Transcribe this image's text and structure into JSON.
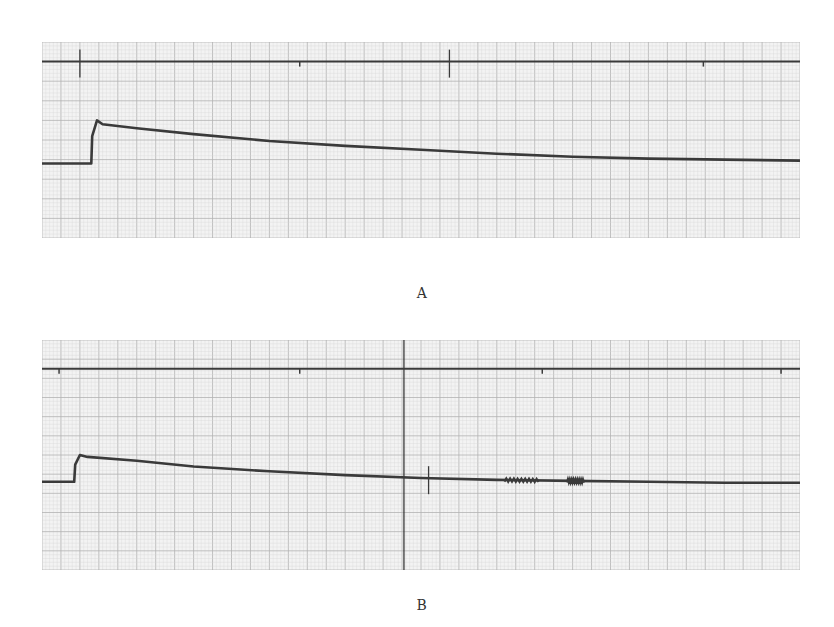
{
  "figure": {
    "panels": [
      {
        "id": "A",
        "label": "A"
      },
      {
        "id": "B",
        "label": "B"
      }
    ]
  },
  "colors": {
    "paper": "#f3f3f3",
    "grid_minor": "#d6d6d6",
    "grid_major": "#b3b3b3",
    "trace": "#3a3a3a",
    "label": "#333333"
  },
  "chart_data": [
    {
      "type": "line",
      "title": "A",
      "xlabel": "",
      "ylabel": "",
      "grid": true,
      "xlim": [
        0,
        40
      ],
      "ylim": [
        0,
        10
      ],
      "major_divisions_x": 40,
      "major_divisions_y": 10,
      "minor_per_major": 5,
      "series": [
        {
          "name": "reference",
          "x": [
            0,
            40
          ],
          "y": [
            9.0,
            9.0
          ],
          "event_marks_x": [
            2.0,
            21.5
          ],
          "small_ticks_x": [
            13.6,
            34.9
          ]
        },
        {
          "name": "signal",
          "x": [
            0,
            2.6,
            2.65,
            2.9,
            3.2,
            5,
            8,
            12,
            16,
            20,
            24,
            28,
            32,
            36,
            40
          ],
          "y": [
            3.8,
            3.8,
            5.2,
            6.0,
            5.8,
            5.6,
            5.3,
            4.95,
            4.7,
            4.5,
            4.3,
            4.15,
            4.05,
            4.0,
            3.95
          ]
        }
      ]
    },
    {
      "type": "line",
      "title": "B",
      "xlabel": "",
      "ylabel": "",
      "grid": true,
      "xlim": [
        0,
        40
      ],
      "ylim": [
        0,
        12
      ],
      "major_divisions_x": 40,
      "major_divisions_y": 12,
      "minor_per_major": 5,
      "series": [
        {
          "name": "reference",
          "x": [
            0,
            40
          ],
          "y": [
            10.5,
            10.5
          ],
          "event_marks_x": [
            19.1
          ],
          "small_ticks_x": [
            0.9,
            13.6,
            26.4,
            39.0
          ]
        },
        {
          "name": "signal",
          "x": [
            0,
            1.7,
            1.75,
            2.0,
            2.4,
            5,
            8,
            12,
            16,
            20,
            24,
            28,
            32,
            36,
            40
          ],
          "y": [
            4.6,
            4.6,
            5.5,
            6.0,
            5.9,
            5.7,
            5.4,
            5.15,
            4.95,
            4.8,
            4.7,
            4.65,
            4.6,
            4.55,
            4.55
          ],
          "event_marks_x": [
            20.4
          ],
          "noise_bursts_x": [
            [
              24.4,
              26.2
            ],
            [
              27.7,
              28.6
            ]
          ]
        }
      ]
    }
  ]
}
